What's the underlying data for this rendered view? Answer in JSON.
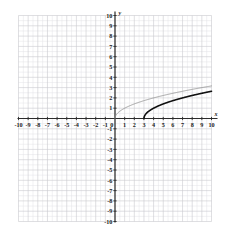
{
  "figure": {
    "kind": "cartesian-coordinate-plane",
    "axis_labels": {
      "x": "x",
      "y": "y"
    },
    "origin_label": "0"
  },
  "chart_data": {
    "type": "line",
    "title": "",
    "xlabel": "x",
    "ylabel": "y",
    "xlim": [
      -10,
      10
    ],
    "ylim": [
      -10,
      10
    ],
    "grid": true,
    "minor_grid": true,
    "minor_divisions_per_unit": 2,
    "legend": "none",
    "xticks": [
      -10,
      -9,
      -8,
      -7,
      -6,
      -5,
      -4,
      -3,
      -2,
      -1,
      0,
      1,
      2,
      3,
      4,
      5,
      6,
      7,
      8,
      9,
      10
    ],
    "yticks": [
      -10,
      -9,
      -8,
      -7,
      -6,
      -5,
      -4,
      -3,
      -2,
      -1,
      1,
      2,
      3,
      4,
      5,
      6,
      7,
      8,
      9,
      10
    ],
    "xtick_labels": [
      "-10",
      "-9",
      "-8",
      "-7",
      "-6",
      "-5",
      "-4",
      "-3",
      "-2",
      "-1",
      "0",
      "1",
      "2",
      "3",
      "4",
      "5",
      "6",
      "7",
      "8",
      "9",
      "10"
    ],
    "ytick_labels": [
      "-10",
      "-9",
      "-8",
      "-7",
      "-6",
      "-5",
      "-4",
      "-3",
      "-2",
      "-1",
      "1",
      "2",
      "3",
      "4",
      "5",
      "6",
      "7",
      "8",
      "9",
      "10"
    ],
    "series": [
      {
        "name": "y = sqrt(x)",
        "color": "#8a8a8a",
        "width": 0.8,
        "domain": [
          0,
          10
        ],
        "x": [
          0,
          0.25,
          0.5,
          1,
          1.5,
          2,
          2.5,
          3,
          4,
          5,
          6,
          7,
          8,
          9,
          10
        ],
        "values": [
          0,
          0.5,
          0.71,
          1,
          1.22,
          1.41,
          1.58,
          1.73,
          2,
          2.24,
          2.45,
          2.65,
          2.83,
          3,
          3.16
        ]
      },
      {
        "name": "y = sqrt(x - 3)",
        "color": "#111111",
        "width": 1.6,
        "domain": [
          3,
          10
        ],
        "x": [
          3,
          3.25,
          3.5,
          4,
          4.5,
          5,
          5.5,
          6,
          7,
          8,
          9,
          10
        ],
        "values": [
          0,
          0.5,
          0.71,
          1,
          1.22,
          1.41,
          1.58,
          1.73,
          2,
          2.24,
          2.45,
          2.65
        ]
      }
    ]
  },
  "colors": {
    "background": "#ffffff",
    "minor_grid": "#e3e3e6",
    "major_grid": "#c9c9cf",
    "axis": "#2b2b2b",
    "curve_light": "#8a8a8a",
    "curve_dark": "#111111"
  },
  "tick_label_texts": {
    "x_negative": [
      "-10",
      "-9",
      "-8",
      "-7",
      "-6",
      "-5",
      "-4",
      "-3",
      "-2",
      "-1"
    ],
    "x_origin": "0",
    "x_positive": [
      "1",
      "2",
      "3",
      "4",
      "5",
      "6",
      "7",
      "8",
      "9",
      "10"
    ],
    "y_positive": [
      "1",
      "2",
      "3",
      "4",
      "5",
      "6",
      "7",
      "8",
      "9",
      "10"
    ],
    "y_negative": [
      "-1",
      "-2",
      "-3",
      "-4",
      "-5",
      "-6",
      "-7",
      "-8",
      "-9",
      "-10"
    ]
  }
}
